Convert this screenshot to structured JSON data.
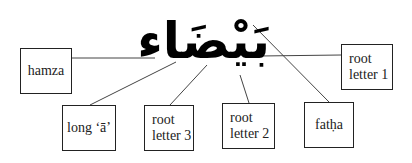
{
  "diagram": {
    "word": "بَيْضَاء",
    "labels": {
      "hamza": "hamza",
      "long_a": "long ‘ā’",
      "root_letter_3": [
        "root",
        "letter 3"
      ],
      "root_letter_2": [
        "root",
        "letter 2"
      ],
      "fatha": "fatḥa",
      "root_letter_1": [
        "root",
        "letter 1"
      ]
    }
  }
}
